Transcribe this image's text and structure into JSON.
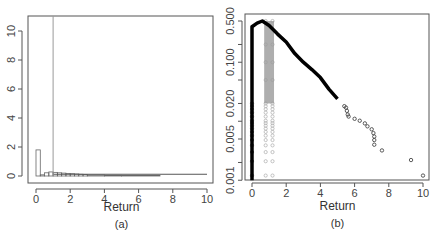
{
  "chart_data": [
    {
      "panel": "(a)",
      "type": "bar",
      "subtype": "histogram with overlaid density line",
      "title": "",
      "xlabel": "Return",
      "ylabel": "",
      "xlim": [
        0,
        10
      ],
      "ylim": [
        0,
        11
      ],
      "x_ticks": [
        "0",
        "2",
        "4",
        "6",
        "8",
        "10"
      ],
      "y_ticks": [
        "0",
        "2",
        "4",
        "6",
        "8",
        "10"
      ],
      "grid": false,
      "legend": null,
      "histogram": {
        "bin_width": 0.25,
        "bins": [
          {
            "from": 0.0,
            "to": 0.25,
            "density": 1.8
          },
          {
            "from": 0.25,
            "to": 0.5,
            "density": 0.08
          },
          {
            "from": 0.5,
            "to": 0.75,
            "density": 0.22
          },
          {
            "from": 0.75,
            "to": 1.0,
            "density": 0.28
          },
          {
            "from": 1.0,
            "to": 1.25,
            "density": 0.25
          },
          {
            "from": 1.25,
            "to": 1.5,
            "density": 0.22
          },
          {
            "from": 1.5,
            "to": 1.75,
            "density": 0.2
          },
          {
            "from": 1.75,
            "to": 2.0,
            "density": 0.18
          },
          {
            "from": 2.0,
            "to": 2.25,
            "density": 0.16
          },
          {
            "from": 2.25,
            "to": 2.5,
            "density": 0.14
          },
          {
            "from": 2.5,
            "to": 2.75,
            "density": 0.12
          },
          {
            "from": 2.75,
            "to": 3.0,
            "density": 0.1
          },
          {
            "from": 3.0,
            "to": 4.0,
            "density": 0.07
          },
          {
            "from": 4.0,
            "to": 5.0,
            "density": 0.05
          },
          {
            "from": 5.0,
            "to": 7.25,
            "density": 0.03
          }
        ]
      },
      "spike": {
        "x": 1.0,
        "height": 11,
        "color": "#999999"
      },
      "baseline_line": {
        "x_from": 1.0,
        "x_to": 10.0,
        "y": 0.12
      }
    },
    {
      "panel": "(b)",
      "type": "scatter",
      "subtype": "log-scale density points",
      "title": "",
      "xlabel": "Return",
      "ylabel": "",
      "xlim": [
        0,
        10
      ],
      "ylim": [
        0.001,
        0.6
      ],
      "yscale": "log",
      "x_ticks": [
        "0",
        "2",
        "4",
        "6",
        "8",
        "10"
      ],
      "y_ticks": [
        "0.001",
        "0.005",
        "0.020",
        "0.100",
        "0.500"
      ],
      "y_minor_ticks": [
        0.002,
        0.01,
        0.05,
        0.2
      ],
      "grid": false,
      "legend": null,
      "series": [
        {
          "name": "main curve (black)",
          "color": "#000000",
          "points": [
            [
              0.0,
              0.001
            ],
            [
              0.0,
              0.4
            ],
            [
              0.3,
              0.46
            ],
            [
              0.6,
              0.5
            ],
            [
              1.0,
              0.42
            ],
            [
              1.5,
              0.3
            ],
            [
              2.0,
              0.22
            ],
            [
              2.5,
              0.14
            ],
            [
              3.0,
              0.1
            ],
            [
              3.5,
              0.075
            ],
            [
              4.0,
              0.055
            ],
            [
              4.5,
              0.035
            ],
            [
              5.0,
              0.024
            ]
          ]
        },
        {
          "name": "tail points (black circles)",
          "color": "#333333",
          "points": [
            [
              5.4,
              0.018
            ],
            [
              5.5,
              0.017
            ],
            [
              5.55,
              0.015
            ],
            [
              5.6,
              0.013
            ],
            [
              5.65,
              0.012
            ],
            [
              6.0,
              0.011
            ],
            [
              6.3,
              0.0102
            ],
            [
              6.6,
              0.0092
            ],
            [
              6.75,
              0.0082
            ],
            [
              7.0,
              0.0073
            ],
            [
              7.1,
              0.0063
            ],
            [
              7.15,
              0.0055
            ],
            [
              7.15,
              0.0048
            ],
            [
              7.15,
              0.004
            ],
            [
              7.6,
              0.0032
            ],
            [
              9.3,
              0.0022
            ],
            [
              10.0,
              0.0012
            ]
          ]
        },
        {
          "name": "column at x=0 (black circles)",
          "color": "#333333",
          "x": 0.0,
          "y_values": [
            0.0012,
            0.0021,
            0.003,
            0.0039,
            0.0048,
            0.0057,
            0.0066,
            0.0075,
            0.0084,
            0.0093,
            0.0102,
            0.012,
            0.014,
            0.016,
            0.018,
            0.02
          ]
        },
        {
          "name": "gray columns at x=0.8 and x=1.2",
          "color": "#aaaaaa",
          "x": [
            0.8,
            1.2
          ],
          "y_values": [
            0.0012,
            0.0021,
            0.003,
            0.0039,
            0.0048,
            0.0057,
            0.0066,
            0.0075,
            0.0084,
            0.0093,
            0.0102,
            0.012,
            0.014,
            0.016,
            0.018,
            0.02,
            0.05,
            0.1,
            0.2,
            0.5
          ]
        }
      ]
    }
  ]
}
